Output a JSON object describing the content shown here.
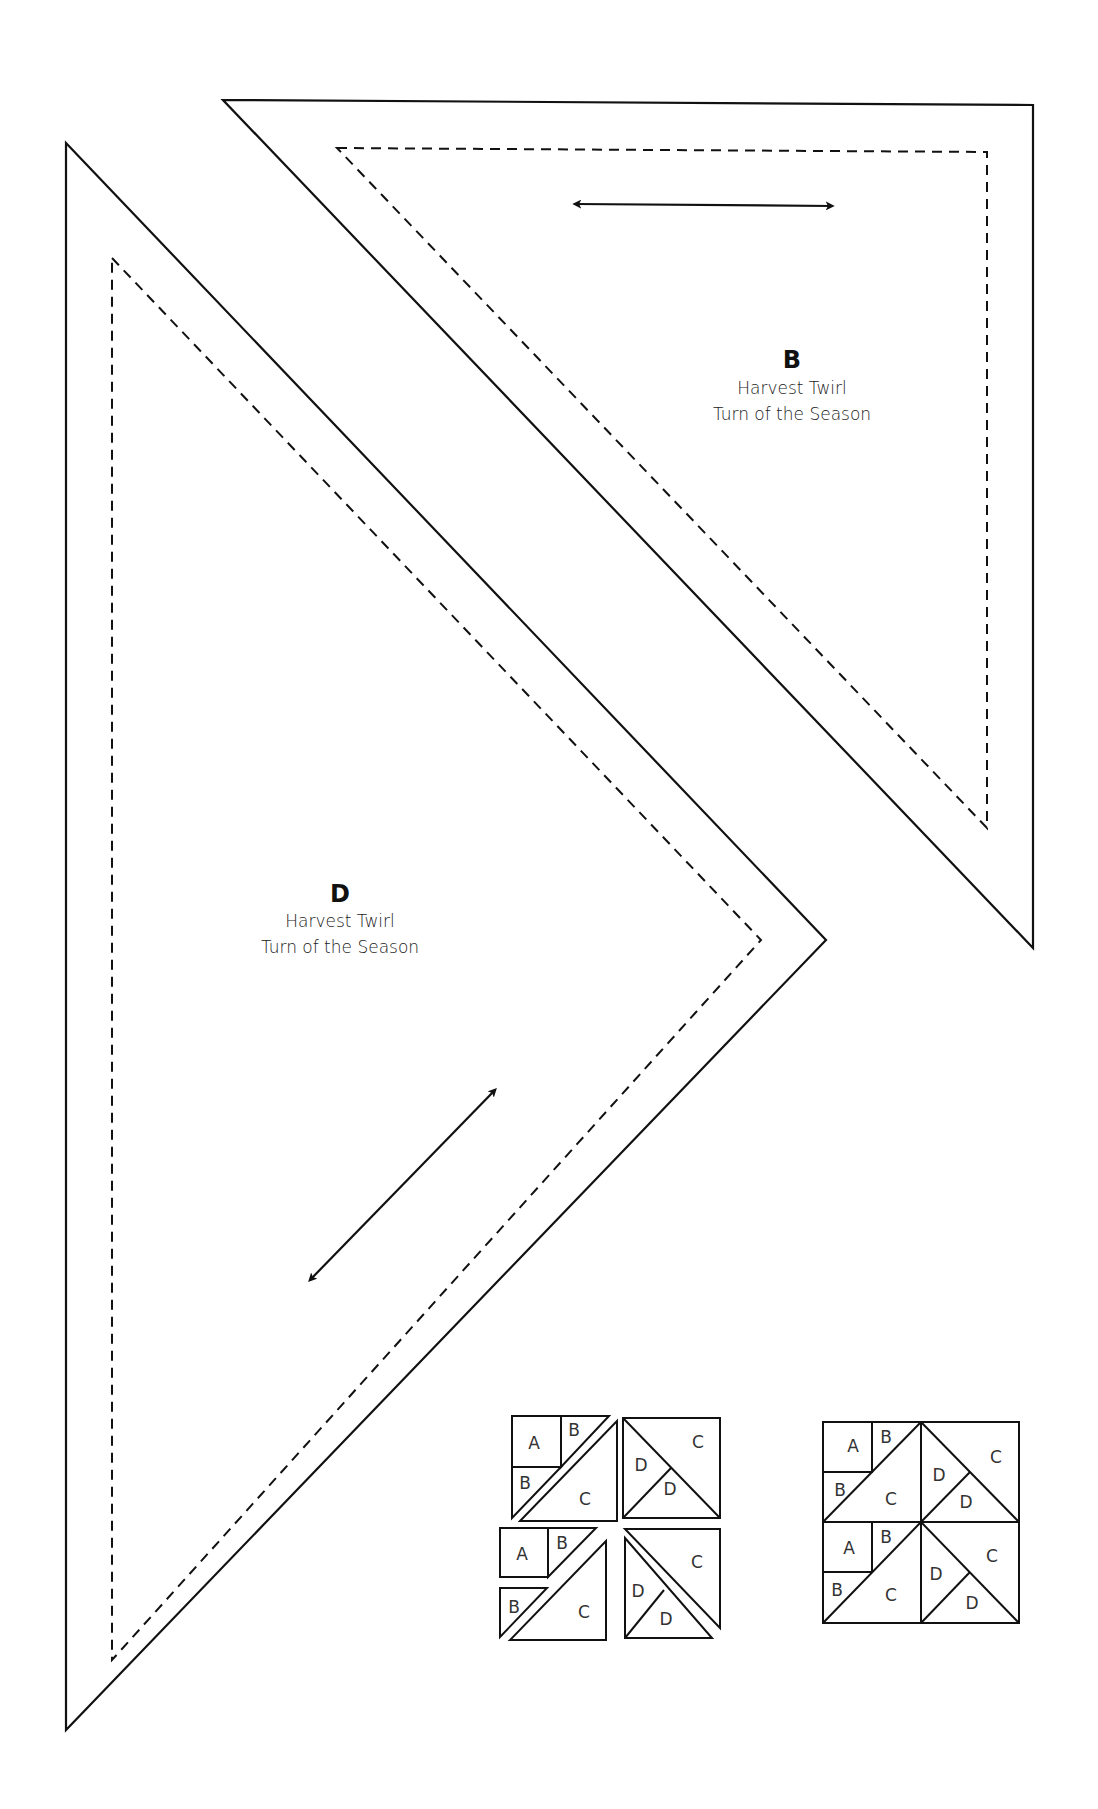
{
  "templates": [
    {
      "id": "D",
      "letter": "D",
      "line1": "Harvest Twirl",
      "line2": "Turn of the Season",
      "outline": "66,143 826,940 66,1730",
      "seam": "112,258 761,940 112,1660",
      "grainline": {
        "x1": 310,
        "y1": 1280,
        "x2": 495,
        "y2": 1090
      },
      "label_pos": {
        "x": 340,
        "y": 902
      }
    },
    {
      "id": "B",
      "letter": "B",
      "line1": "Harvest Twirl",
      "line2": "Turn of the Season",
      "outline": "223,100 1033,105 1033,948",
      "seam": "337,148 987,152 987,828",
      "grainline": {
        "x1": 575,
        "y1": 204,
        "x2": 832,
        "y2": 206
      },
      "label_pos": {
        "x": 792,
        "y": 368
      }
    }
  ],
  "block_diagrams": {
    "exploded": {
      "quadrants": [
        {
          "pieces": [
            "A",
            "B",
            "B",
            "C"
          ]
        },
        {
          "pieces": [
            "D",
            "D",
            "C"
          ]
        },
        {
          "pieces": [
            "A",
            "B",
            "B",
            "C"
          ]
        },
        {
          "pieces": [
            "D",
            "D",
            "C"
          ]
        }
      ]
    },
    "assembled": {
      "quadrants": [
        {
          "pieces": [
            "A",
            "B",
            "B",
            "C"
          ]
        },
        {
          "pieces": [
            "D",
            "D",
            "C"
          ]
        },
        {
          "pieces": [
            "A",
            "B",
            "B",
            "C"
          ]
        },
        {
          "pieces": [
            "D",
            "D",
            "C"
          ]
        }
      ]
    }
  },
  "letters": {
    "A": "A",
    "B": "B",
    "C": "C",
    "D": "D"
  }
}
